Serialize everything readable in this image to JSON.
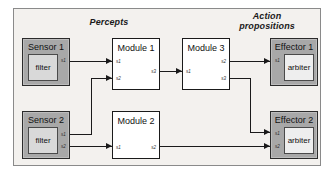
{
  "diagram": {
    "headers": {
      "percepts": "Percepts",
      "action_propositions": "Action\npropositions"
    },
    "nodes": {
      "sensor1": {
        "title": "Sensor 1",
        "inner": "filter",
        "ports_out": [
          "s1"
        ]
      },
      "sensor2": {
        "title": "Sensor 2",
        "inner": "filter",
        "ports_out": [
          "s1",
          "s2"
        ]
      },
      "module1": {
        "title": "Module 1",
        "ports_in": [
          "s1",
          "s2"
        ],
        "ports_out": [
          "s3"
        ]
      },
      "module2": {
        "title": "Module 2",
        "ports_in": [
          "s1"
        ],
        "ports_out": [
          "s2"
        ]
      },
      "module3": {
        "title": "Module 3",
        "ports_in": [
          "s1"
        ],
        "ports_out": [
          "s2",
          "s3"
        ]
      },
      "effector1": {
        "title": "Effector 1",
        "inner": "arbiter",
        "ports_in": [
          "s1"
        ]
      },
      "effector2": {
        "title": "Effector 2",
        "inner": "arbiter",
        "ports_in": [
          "s1",
          "s2"
        ]
      }
    },
    "colors": {
      "panel_background": "#f3f1ee",
      "device_shell": "#a8a8a8",
      "device_inner": "#d9d9d9",
      "module_fill": "#ffffff",
      "line": "#1a1a1a"
    }
  }
}
